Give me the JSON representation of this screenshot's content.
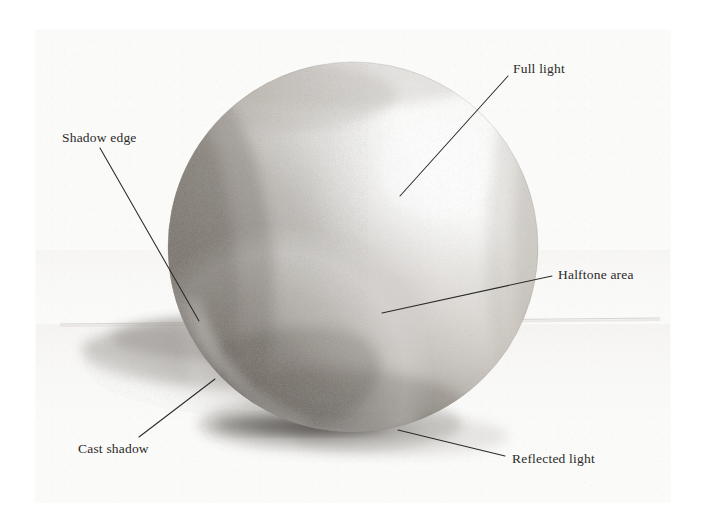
{
  "artwork": {
    "subject": "Shaded sphere with cast shadow",
    "medium": "graphite pencil drawing",
    "paper_color": "#fbfbfa",
    "ink_color": "#2b2a28"
  },
  "annotations": [
    {
      "id": "full-light",
      "label": "Full light",
      "label_x": 513,
      "label_y": 62,
      "leader": {
        "x1": 508,
        "y1": 76,
        "x2": 400,
        "y2": 196
      }
    },
    {
      "id": "shadow-edge",
      "label": "Shadow edge",
      "label_x": 62,
      "label_y": 131,
      "leader": {
        "x1": 100,
        "y1": 148,
        "x2": 199,
        "y2": 321
      }
    },
    {
      "id": "halftone-area",
      "label": "Halftone area",
      "label_x": 558,
      "label_y": 268,
      "leader": {
        "x1": 552,
        "y1": 276,
        "x2": 382,
        "y2": 313
      }
    },
    {
      "id": "cast-shadow",
      "label": "Cast shadow",
      "label_x": 78,
      "label_y": 442,
      "leader": {
        "x1": 139,
        "y1": 437,
        "x2": 215,
        "y2": 379
      }
    },
    {
      "id": "reflected-light",
      "label": "Reflected light",
      "label_x": 512,
      "label_y": 452,
      "leader": {
        "x1": 505,
        "y1": 456,
        "x2": 398,
        "y2": 430
      }
    }
  ],
  "sphere": {
    "center_x": 353,
    "center_y": 247,
    "radius": 185,
    "light_direction": "upper-right"
  },
  "ground": {
    "horizon_y": 322,
    "cast_shadow_direction": "left"
  }
}
